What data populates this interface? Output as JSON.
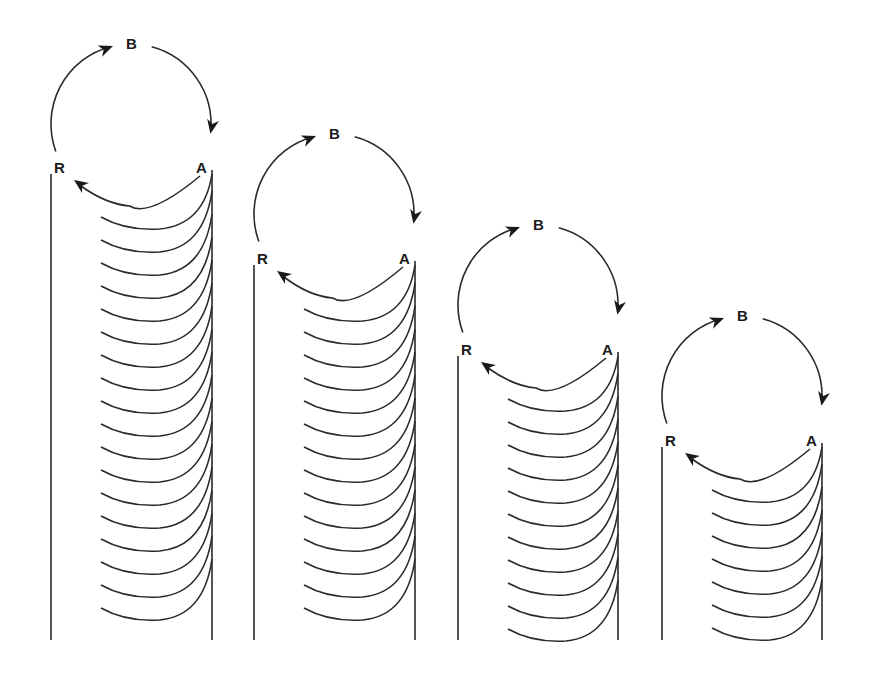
{
  "diagram": {
    "title": "",
    "colors": {
      "line": "#2a2a2a",
      "label": "#1a1a1a",
      "background": "#ffffff"
    },
    "bottom_y": 640,
    "arc_spacing": 23,
    "columns": [
      {
        "id": "column-1",
        "labels": {
          "b": "B",
          "a": "A",
          "r": "R"
        },
        "circle": {
          "cx": 131,
          "cy": 124,
          "r": 80
        },
        "left_x": 51,
        "right_x": 212,
        "top_y": 174,
        "arrow_arc_bottom_y": 206,
        "arc_count": 19
      },
      {
        "id": "column-2",
        "labels": {
          "b": "B",
          "a": "A",
          "r": "R"
        },
        "circle": {
          "cx": 334,
          "cy": 214,
          "r": 80
        },
        "left_x": 254,
        "right_x": 415,
        "top_y": 265,
        "arrow_arc_bottom_y": 298,
        "arc_count": 15
      },
      {
        "id": "column-3",
        "labels": {
          "b": "B",
          "a": "A",
          "r": "R"
        },
        "circle": {
          "cx": 538,
          "cy": 305,
          "r": 80
        },
        "left_x": 458,
        "right_x": 618,
        "top_y": 356,
        "arrow_arc_bottom_y": 388,
        "arc_count": 11
      },
      {
        "id": "column-4",
        "labels": {
          "b": "B",
          "a": "A",
          "r": "R"
        },
        "circle": {
          "cx": 742,
          "cy": 396,
          "r": 80
        },
        "left_x": 662,
        "right_x": 822,
        "top_y": 447,
        "arrow_arc_bottom_y": 479,
        "arc_count": 7
      }
    ]
  }
}
